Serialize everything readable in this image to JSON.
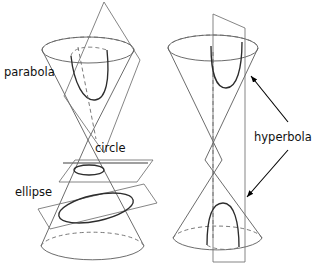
{
  "figure": {
    "background_color": "#ffffff",
    "line_color": "#5b5b5b",
    "curve_color": "#2c2c2c",
    "arrow_color": "#000000"
  },
  "labels": {
    "parabola": "parabola",
    "circle": "circle",
    "ellipse": "ellipse",
    "hyperbola": "hyperbola"
  },
  "left_figure": {
    "name": "double-cone-with-parabola-circle-ellipse",
    "conics": [
      "parabola",
      "circle",
      "ellipse"
    ],
    "planes": 3
  },
  "right_figure": {
    "name": "double-cone-with-hyperbola",
    "conics": [
      "hyperbola"
    ],
    "planes": 1,
    "arrow_count": 2
  }
}
